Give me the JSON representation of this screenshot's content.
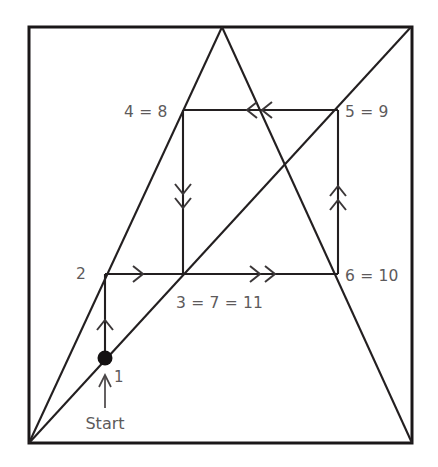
{
  "figure": {
    "background_color": "#ffffff",
    "line_color": "#231f20",
    "label_color": "#5d5a5b",
    "marker_color": "#141112"
  },
  "labels": {
    "start": "Start",
    "point_1": "1",
    "point_2": "2",
    "point_4_8": "4 = 8",
    "point_5_9": "5 = 9",
    "point_3_7_11": "3 = 7 = 11",
    "point_6_10": "6 = 10"
  },
  "geometry": {
    "frame": {
      "left": 29,
      "top": 27,
      "right": 412,
      "bottom": 443
    },
    "inner_square": {
      "left": 183,
      "top": 110,
      "right": 338,
      "bottom": 274
    },
    "apex": {
      "x": 222,
      "y": 27
    },
    "start_dot": {
      "x": 105,
      "y": 358
    },
    "point_2": {
      "x": 105,
      "y": 274
    }
  },
  "arrows": {
    "segment_1_to_2": {
      "direction": "up",
      "chevrons": 1
    },
    "segment_2_to_3": {
      "direction": "right",
      "chevrons": 1
    },
    "segment_3_to_6": {
      "direction": "right",
      "chevrons": 2
    },
    "segment_6_to_5": {
      "direction": "up",
      "chevrons": 2
    },
    "segment_5_to_4": {
      "direction": "left",
      "chevrons": 2
    },
    "segment_4_to_3": {
      "direction": "down",
      "chevrons": 2
    },
    "start_pointer": {
      "direction": "up",
      "chevrons": 1
    }
  }
}
